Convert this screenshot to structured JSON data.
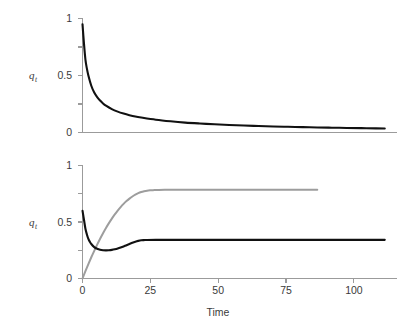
{
  "figure": {
    "background_color": "#ffffff",
    "panels": [
      {
        "id": "top-panel",
        "ylabel_main": "q",
        "ylabel_sub": "t",
        "ytick_labels": [
          "0",
          "0.5",
          "1"
        ],
        "xtick_labels": []
      },
      {
        "id": "bottom-panel",
        "ylabel_main": "q",
        "ylabel_sub": "t",
        "ytick_labels": [
          "0",
          "0.5",
          "1"
        ],
        "xtick_labels": [
          "0",
          "25",
          "50",
          "75",
          "100"
        ],
        "xlabel": "Time"
      }
    ]
  },
  "chart_data": [
    {
      "type": "line",
      "title": "",
      "subtitle": "",
      "xlabel": "",
      "ylabel": "q_t",
      "xlim": [
        0,
        107
      ],
      "ylim": [
        0,
        1
      ],
      "xticks": [
        0,
        25,
        50,
        75,
        100
      ],
      "xtick_labels": [],
      "yticks": [
        0,
        0.25,
        0.5,
        0.75,
        1
      ],
      "ytick_labels": [
        "0",
        "",
        "0.5",
        "",
        "1"
      ],
      "grid": false,
      "legend": "none",
      "series": [
        {
          "name": "q_t",
          "color": "#111111",
          "x": [
            0,
            0.5,
            1,
            1.5,
            2,
            3,
            4,
            5,
            6,
            7,
            8,
            10,
            12,
            14,
            16,
            18,
            20,
            25,
            30,
            35,
            40,
            45,
            50,
            55,
            60,
            65,
            70,
            75,
            80,
            85,
            90,
            95,
            100,
            103
          ],
          "y": [
            0.95,
            0.78,
            0.64,
            0.56,
            0.5,
            0.41,
            0.35,
            0.31,
            0.28,
            0.255,
            0.235,
            0.205,
            0.183,
            0.166,
            0.152,
            0.14,
            0.131,
            0.112,
            0.098,
            0.087,
            0.079,
            0.072,
            0.066,
            0.061,
            0.057,
            0.053,
            0.05,
            0.047,
            0.044,
            0.042,
            0.04,
            0.038,
            0.036,
            0.035
          ]
        }
      ]
    },
    {
      "type": "line",
      "title": "",
      "subtitle": "",
      "xlabel": "Time",
      "ylabel": "q_t",
      "xlim": [
        0,
        107
      ],
      "ylim": [
        0,
        1
      ],
      "xticks": [
        0,
        25,
        50,
        75,
        100
      ],
      "xtick_labels": [
        "0",
        "25",
        "50",
        "75",
        "100"
      ],
      "yticks": [
        0,
        0.25,
        0.5,
        0.75,
        1
      ],
      "ytick_labels": [
        "0",
        "",
        "0.5",
        "",
        "1"
      ],
      "grid": false,
      "legend": "none",
      "series": [
        {
          "name": "q_t (black)",
          "color": "#111111",
          "x": [
            0,
            0.5,
            1,
            1.5,
            2,
            2.5,
            3,
            4,
            5,
            6,
            7,
            8,
            9,
            10,
            11,
            12,
            13,
            14,
            15,
            16,
            17,
            18,
            19,
            20,
            21,
            22,
            25,
            30,
            40,
            50,
            60,
            70,
            80,
            90,
            100,
            103
          ],
          "y": [
            0.6,
            0.52,
            0.44,
            0.39,
            0.35,
            0.325,
            0.305,
            0.278,
            0.263,
            0.254,
            0.25,
            0.249,
            0.25,
            0.253,
            0.258,
            0.265,
            0.274,
            0.284,
            0.295,
            0.306,
            0.317,
            0.326,
            0.333,
            0.338,
            0.34,
            0.341,
            0.342,
            0.342,
            0.342,
            0.342,
            0.342,
            0.342,
            0.342,
            0.342,
            0.342,
            0.342
          ]
        },
        {
          "name": "q_t (gray)",
          "color": "#9d9d9d",
          "x": [
            0,
            1,
            2,
            3,
            4,
            5,
            6,
            7,
            8,
            9,
            10,
            11,
            12,
            13,
            14,
            15,
            16,
            17,
            18,
            19,
            20,
            21,
            22,
            23,
            24,
            25,
            26,
            28,
            30,
            35,
            40,
            50,
            60,
            70,
            80,
            90,
            100,
            103
          ],
          "y": [
            0.0,
            0.065,
            0.128,
            0.188,
            0.245,
            0.3,
            0.352,
            0.401,
            0.447,
            0.49,
            0.53,
            0.567,
            0.601,
            0.632,
            0.66,
            0.685,
            0.707,
            0.726,
            0.742,
            0.755,
            0.765,
            0.772,
            0.777,
            0.78,
            0.782,
            0.783,
            0.784,
            0.785,
            0.785,
            0.785,
            0.785,
            0.785,
            0.785,
            0.785,
            0.785,
            0.785
          ]
        }
      ]
    }
  ]
}
